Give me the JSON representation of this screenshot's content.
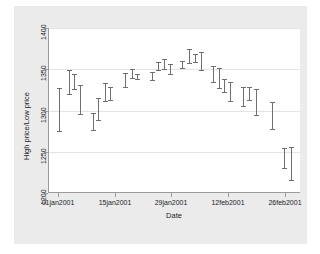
{
  "chart_data": {
    "type": "bar",
    "chart_style": "high-low range plot (vertical bars with end caps)",
    "title": "",
    "xlabel": "Date",
    "ylabel": "High price/Low price",
    "ylim": [
      1200,
      1400
    ],
    "yticks": [
      1200,
      1250,
      1300,
      1350,
      1400
    ],
    "ytick_labels": [
      "1200",
      "1250",
      "1300",
      "1350",
      "1400"
    ],
    "xlim": [
      "01jan2001",
      "26feb2001"
    ],
    "xticks": [
      "01jan2001",
      "15jan2001",
      "29jan2001",
      "12feb2001",
      "26feb2001"
    ],
    "xtick_labels": [
      "01jan2001",
      "15jan2001",
      "29jan2001",
      "12feb2001",
      "26feb2001"
    ],
    "grid": "horizontal gridlines at y ticks",
    "legend": "none",
    "series": [
      {
        "name": "High price",
        "values": [
          1327,
          1349,
          1344,
          1331,
          1297,
          1315,
          1333,
          1328,
          1345,
          1350,
          1344,
          1359,
          1363,
          1356,
          1360,
          1374,
          1369,
          1371,
          1354,
          1352,
          1338,
          1335,
          1329,
          1328,
          1326,
          1324,
          1310,
          1254,
          1256
        ]
      },
      {
        "name": "Low price",
        "values": [
          1275,
          1320,
          1326,
          1296,
          1276,
          1288,
          1311,
          1313,
          1329,
          1340,
          1338,
          1349,
          1350,
          1344,
          1351,
          1358,
          1359,
          1349,
          1335,
          1327,
          1312,
          1322,
          1305,
          1313,
          1295,
          1278,
          1254,
          1230,
          1216
        ]
      }
    ],
    "bars": [
      {
        "x": "01jan2001",
        "high": 1327,
        "low": 1275
      },
      {
        "x": "02jan2001",
        "high": 1349,
        "low": 1320
      },
      {
        "x": "03jan2001",
        "high": 1344,
        "low": 1326
      },
      {
        "x": "04jan2001",
        "high": 1331,
        "low": 1296
      },
      {
        "x": "08jan2001",
        "high": 1297,
        "low": 1276
      },
      {
        "x": "09jan2001",
        "high": 1315,
        "low": 1288
      },
      {
        "x": "10jan2001",
        "high": 1333,
        "low": 1311
      },
      {
        "x": "11jan2001",
        "high": 1328,
        "low": 1313
      },
      {
        "x": "16jan2001",
        "high": 1345,
        "low": 1329
      },
      {
        "x": "17jan2001",
        "high": 1350,
        "low": 1340
      },
      {
        "x": "18jan2001",
        "high": 1344,
        "low": 1338
      },
      {
        "x": "22jan2001",
        "high": 1359,
        "low": 1349
      },
      {
        "x": "23jan2001",
        "high": 1363,
        "low": 1350
      },
      {
        "x": "24jan2001",
        "high": 1356,
        "low": 1344
      },
      {
        "x": "29jan2001",
        "high": 1360,
        "low": 1351
      },
      {
        "x": "30jan2001",
        "high": 1374,
        "low": 1358
      },
      {
        "x": "31jan2001",
        "high": 1369,
        "low": 1359
      },
      {
        "x": "01feb2001",
        "high": 1371,
        "low": 1349
      },
      {
        "x": "05feb2001",
        "high": 1354,
        "low": 1335
      },
      {
        "x": "06feb2001",
        "high": 1352,
        "low": 1327
      },
      {
        "x": "07feb2001",
        "high": 1338,
        "low": 1322
      },
      {
        "x": "08feb2001",
        "high": 1335,
        "low": 1312
      },
      {
        "x": "12feb2001",
        "high": 1329,
        "low": 1305
      },
      {
        "x": "13feb2001",
        "high": 1328,
        "low": 1313
      },
      {
        "x": "14feb2001",
        "high": 1326,
        "low": 1295
      },
      {
        "x": "20feb2001",
        "high": 1310,
        "low": 1278
      },
      {
        "x": "22feb2001",
        "high": 1254,
        "low": 1230
      },
      {
        "x": "26feb2001",
        "high": 1256,
        "low": 1216
      }
    ],
    "bar_pixel_layout": [
      {
        "x": 58,
        "high": 1327,
        "low": 1275
      },
      {
        "x": 68,
        "high": 1349,
        "low": 1320
      },
      {
        "x": 73,
        "high": 1344,
        "low": 1326
      },
      {
        "x": 79,
        "high": 1331,
        "low": 1296
      },
      {
        "x": 92,
        "high": 1297,
        "low": 1276
      },
      {
        "x": 97,
        "high": 1315,
        "low": 1288
      },
      {
        "x": 104,
        "high": 1333,
        "low": 1311
      },
      {
        "x": 109,
        "high": 1328,
        "low": 1313
      },
      {
        "x": 124,
        "high": 1345,
        "low": 1329
      },
      {
        "x": 131,
        "high": 1350,
        "low": 1340
      },
      {
        "x": 136,
        "high": 1344,
        "low": 1338
      },
      {
        "x": 151,
        "high": 1347,
        "low": 1337
      },
      {
        "x": 157,
        "high": 1359,
        "low": 1349
      },
      {
        "x": 163,
        "high": 1363,
        "low": 1350
      },
      {
        "x": 169,
        "high": 1356,
        "low": 1344
      },
      {
        "x": 181,
        "high": 1360,
        "low": 1351
      },
      {
        "x": 188,
        "high": 1374,
        "low": 1358
      },
      {
        "x": 194,
        "high": 1369,
        "low": 1359
      },
      {
        "x": 200,
        "high": 1371,
        "low": 1349
      },
      {
        "x": 212,
        "high": 1354,
        "low": 1335
      },
      {
        "x": 218,
        "high": 1352,
        "low": 1327
      },
      {
        "x": 223,
        "high": 1338,
        "low": 1322
      },
      {
        "x": 229,
        "high": 1335,
        "low": 1312
      },
      {
        "x": 242,
        "high": 1329,
        "low": 1305
      },
      {
        "x": 248,
        "high": 1328,
        "low": 1313
      },
      {
        "x": 255,
        "high": 1326,
        "low": 1295
      },
      {
        "x": 271,
        "high": 1310,
        "low": 1278
      },
      {
        "x": 283,
        "high": 1254,
        "low": 1230
      },
      {
        "x": 290,
        "high": 1256,
        "low": 1216
      }
    ],
    "colors": {
      "bar": "#6f6f6f",
      "plot_background": "#ffffff",
      "graph_background": "#ebebeb",
      "axis": "#9a9a9a",
      "gridline": "#e4e4e4",
      "text": "#22221f"
    }
  }
}
